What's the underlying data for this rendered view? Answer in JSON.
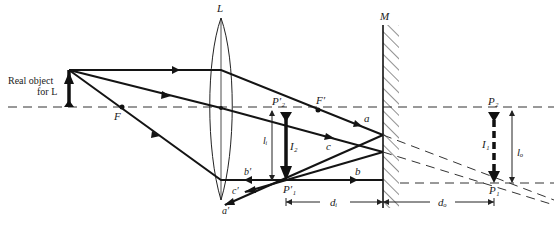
{
  "figure": {
    "type": "optics-ray-diagram"
  },
  "labels": {
    "object": [
      "Real object",
      "for L"
    ],
    "lens": "L",
    "mirror": "M",
    "focal_left": "F",
    "focal_right": "F′",
    "image_lens_top": "P′₂",
    "image_lens_bottom": "P′₁",
    "image_mirror_top": "P₂",
    "image_mirror_bottom": "P₁",
    "height_li": "lᵢ",
    "height_lo": "lₒ",
    "image_I2": "I₂",
    "image_I1": "I₁",
    "ray_a": "a",
    "ray_b": "b",
    "ray_c": "c",
    "ray_a_reflected": "a′",
    "ray_b_reflected": "b′",
    "ray_c_reflected": "c′",
    "distance_di": "dᵢ",
    "distance_do": "dₒ"
  },
  "colors": {
    "ink": "#141414",
    "background": "#ffffff"
  }
}
